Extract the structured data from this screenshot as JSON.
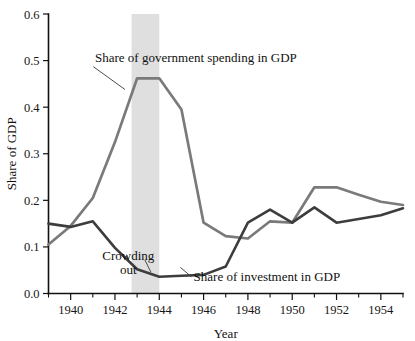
{
  "chart_data": {
    "type": "line",
    "title": "",
    "xlabel": "Year",
    "ylabel": "Share of GDP",
    "xlim": [
      1939,
      1955
    ],
    "ylim": [
      0.0,
      0.6
    ],
    "grid": false,
    "legend_position": "inline-annotations",
    "x": [
      1939,
      1940,
      1941,
      1942,
      1943,
      1944,
      1945,
      1946,
      1947,
      1948,
      1949,
      1950,
      1951,
      1952,
      1953,
      1954,
      1955
    ],
    "xticks": [
      "1940",
      "1942",
      "1944",
      "1946",
      "1948",
      "1950",
      "1952",
      "1954"
    ],
    "xtick_values": [
      1940,
      1942,
      1944,
      1946,
      1948,
      1950,
      1952,
      1954
    ],
    "xminor_values": [
      1939,
      1941,
      1943,
      1945,
      1947,
      1949,
      1951,
      1953,
      1955
    ],
    "yticks": [
      "0.0",
      "0.1",
      "0.2",
      "0.3",
      "0.4",
      "0.5",
      "0.6"
    ],
    "ytick_values": [
      0.0,
      0.1,
      0.2,
      0.3,
      0.4,
      0.5,
      0.6
    ],
    "series": [
      {
        "name": "Share of government spending in GDP",
        "color": "#7a7a7a",
        "values": [
          0.105,
          0.145,
          0.205,
          0.325,
          0.462,
          0.462,
          0.395,
          0.152,
          0.123,
          0.118,
          0.155,
          0.152,
          0.228,
          0.228,
          0.212,
          0.197,
          0.19
        ]
      },
      {
        "name": "Share of investment in GDP",
        "color": "#3d3d3d",
        "values": [
          0.15,
          0.143,
          0.155,
          0.098,
          0.052,
          0.036,
          0.038,
          0.04,
          0.058,
          0.152,
          0.18,
          0.152,
          0.185,
          0.152,
          0.16,
          0.168,
          0.183
        ]
      }
    ],
    "shaded_band": {
      "label": "Crowding out",
      "x_start": 1942.75,
      "x_end": 1944.0,
      "color": "#d6d6d6"
    },
    "annotations": [
      {
        "text": "Share of government spending in GDP",
        "x": 1941.1,
        "y": 0.498,
        "anchor": "start"
      },
      {
        "text": "Crowding out",
        "x": 1942.6,
        "y": 0.088,
        "anchor": "middle"
      },
      {
        "text": "Share of investment in GDP",
        "x": 1945.55,
        "y": 0.027,
        "anchor": "start"
      }
    ]
  }
}
